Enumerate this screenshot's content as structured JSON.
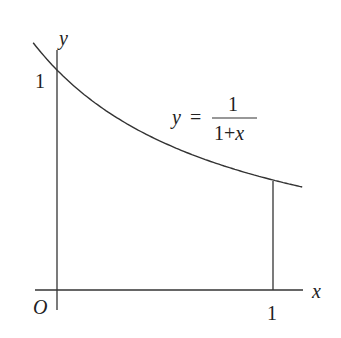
{
  "chart_data": {
    "type": "line",
    "title": "",
    "function": "y = 1/(1+x)",
    "xlabel": "x",
    "ylabel": "y",
    "origin_label": "O",
    "x_ticks": [
      {
        "value": 1,
        "label": "1"
      }
    ],
    "y_ticks": [
      {
        "value": 1,
        "label": "1"
      }
    ],
    "x": [
      -0.1,
      0,
      0.25,
      0.5,
      0.75,
      1,
      1.15
    ],
    "values": [
      1.111,
      1.0,
      0.8,
      0.667,
      0.571,
      0.5,
      0.465
    ],
    "annotations": [
      {
        "text": "y = 1/(1+x)",
        "near": "curve"
      },
      {
        "text": "vertical line at x = 1 from axis to curve"
      }
    ],
    "grid": false,
    "legend": null
  },
  "labels": {
    "y_axis": "y",
    "x_axis": "x",
    "origin": "O",
    "y_tick_one": "1",
    "x_tick_one": "1",
    "eq_lhs": "y",
    "eq_equals": "=",
    "eq_numerator": "1",
    "eq_denominator_one": "1+",
    "eq_denominator_x": "x"
  },
  "colors": {
    "stroke": "#333333",
    "text": "#222222"
  }
}
